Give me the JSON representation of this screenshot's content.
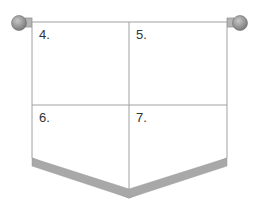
{
  "diagram": {
    "type": "pennant-banner",
    "panels": [
      {
        "label": "4."
      },
      {
        "label": "5."
      },
      {
        "label": "6."
      },
      {
        "label": "7."
      }
    ],
    "colors": {
      "outline": "#9a9a9a",
      "band": "#a8a8a8",
      "knob": "#8f8f8f",
      "background": "#ffffff"
    }
  }
}
